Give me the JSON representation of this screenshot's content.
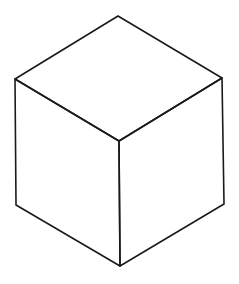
{
  "figure": {
    "type": "isometric-cube-line-drawing",
    "background": "#ffffff",
    "stroke_color": "#1a1a1a",
    "stroke_width": 1.6,
    "vertices": {
      "top": [
        118,
        16
      ],
      "left_top": [
        15,
        79
      ],
      "right_top": [
        222,
        78
      ],
      "center": [
        119,
        141
      ],
      "left_bottom": [
        16,
        205
      ],
      "right_bottom": [
        224,
        204
      ],
      "bottom": [
        120,
        266
      ]
    },
    "faces": [
      {
        "name": "top-face",
        "points": [
          "top",
          "right_top",
          "center",
          "left_top"
        ]
      },
      {
        "name": "left-face",
        "points": [
          "left_top",
          "center",
          "bottom",
          "left_bottom"
        ]
      },
      {
        "name": "right-face",
        "points": [
          "center",
          "right_top",
          "right_bottom",
          "bottom"
        ]
      }
    ]
  }
}
